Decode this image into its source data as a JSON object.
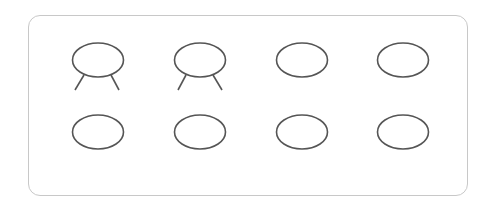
{
  "diagram": {
    "colors": {
      "stroke": "#555555",
      "panel_border": "#c8c8c8"
    },
    "rows": [
      {
        "items": [
          {
            "shape": "ellipse-with-legs",
            "cx": 98,
            "cy": 60
          },
          {
            "shape": "ellipse-with-legs",
            "cx": 200,
            "cy": 60
          },
          {
            "shape": "ellipse",
            "cx": 302,
            "cy": 60
          },
          {
            "shape": "ellipse",
            "cx": 403,
            "cy": 60
          }
        ]
      },
      {
        "items": [
          {
            "shape": "ellipse",
            "cx": 98,
            "cy": 132
          },
          {
            "shape": "ellipse",
            "cx": 200,
            "cy": 132
          },
          {
            "shape": "ellipse",
            "cx": 302,
            "cy": 132
          },
          {
            "shape": "ellipse",
            "cx": 403,
            "cy": 132
          }
        ]
      }
    ]
  }
}
